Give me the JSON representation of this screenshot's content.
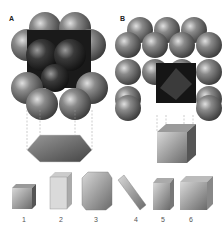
{
  "panels": {
    "a": {
      "label": "A",
      "description": "hexagonal close-packed sphere lattice projecting to hexagonal prism"
    },
    "b": {
      "label": "B",
      "description": "cubic sphere lattice projecting to cube unit cell"
    }
  },
  "crystal_systems": [
    {
      "number": "1",
      "shape": "cubic"
    },
    {
      "number": "2",
      "shape": "tetragonal"
    },
    {
      "number": "3",
      "shape": "hexagonal"
    },
    {
      "number": "4",
      "shape": "triclinic"
    },
    {
      "number": "5",
      "shape": "monoclinic"
    },
    {
      "number": "6",
      "shape": "orthorhombic"
    }
  ],
  "colors": {
    "sphere": "#6e6e6e",
    "sphere_dark": "#2a2a2a",
    "highlight": "#dcdcdc",
    "line": "#999999"
  }
}
